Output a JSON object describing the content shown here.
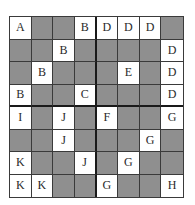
{
  "puzzle": {
    "rows": 8,
    "cols": 8,
    "colors": {
      "filled": "#8f8f8f",
      "empty": "#ffffff",
      "line": "#3a3a3a"
    },
    "grid": [
      [
        "A",
        "",
        "",
        "B",
        "D",
        "D",
        "D",
        ""
      ],
      [
        "",
        "",
        "B",
        "",
        "",
        "",
        "",
        "D"
      ],
      [
        "",
        "B",
        "",
        "",
        "",
        "E",
        "",
        "D"
      ],
      [
        "B",
        "",
        "",
        "C",
        "",
        "",
        "",
        "D"
      ],
      [
        "I",
        "",
        "J",
        "",
        "F",
        "",
        "",
        "G"
      ],
      [
        "",
        "",
        "J",
        "",
        "",
        "",
        "G",
        ""
      ],
      [
        "K",
        "",
        "",
        "J",
        "",
        "G",
        "",
        ""
      ],
      [
        "K",
        "K",
        "",
        "",
        "G",
        "",
        "",
        "H"
      ]
    ]
  }
}
